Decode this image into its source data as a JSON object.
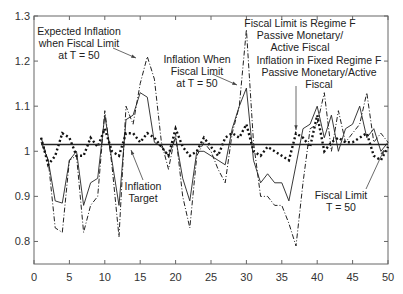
{
  "chart_data": {
    "type": "line",
    "title": "",
    "xlabel": "",
    "ylabel": "",
    "xlim": [
      0,
      50
    ],
    "ylim": [
      0.75,
      1.3
    ],
    "grid": false,
    "x_ticks": [
      0,
      5,
      10,
      15,
      20,
      25,
      30,
      35,
      40,
      45,
      50
    ],
    "y_ticks": [
      0.8,
      0.9,
      1.0,
      1.1,
      1.2,
      1.3
    ],
    "y_tick_labels": [
      "0.8",
      "0.9",
      "1",
      "1.1",
      "1.2",
      "1.3"
    ],
    "x": [
      1,
      2,
      3,
      4,
      5,
      6,
      7,
      8,
      9,
      10,
      11,
      12,
      13,
      14,
      15,
      16,
      17,
      18,
      19,
      20,
      21,
      22,
      23,
      24,
      25,
      26,
      27,
      28,
      29,
      30,
      31,
      32,
      33,
      34,
      35,
      36,
      37,
      38,
      39,
      40,
      41,
      42,
      43,
      44,
      45,
      46,
      47,
      48,
      49,
      50
    ],
    "series": [
      {
        "name": "Inflation When Fiscal Limit at T = 50",
        "style": "solid",
        "values": [
          1.02,
          0.98,
          0.89,
          0.885,
          0.98,
          1.0,
          0.88,
          0.93,
          0.94,
          1.08,
          0.98,
          0.88,
          1.07,
          1.08,
          1.13,
          1.12,
          1.02,
          1.01,
          0.99,
          1.03,
          0.94,
          0.89,
          1.0,
          1.0,
          0.99,
          0.98,
          0.97,
          1.05,
          1.1,
          1.14,
          0.98,
          0.93,
          0.95,
          0.93,
          0.93,
          0.89,
          0.97,
          1.05,
          1.06,
          1.1,
          1.03,
          1.08,
          1.0,
          1.05,
          1.06,
          1.1,
          1.03,
          1.05,
          1.0,
          1.02
        ]
      },
      {
        "name": "Expected Inflation when Fiscal Limit at T = 50",
        "style": "dash-dot",
        "values": [
          1.03,
          0.98,
          0.83,
          0.82,
          0.98,
          0.99,
          0.82,
          0.88,
          0.9,
          1.09,
          0.97,
          0.81,
          1.1,
          1.06,
          1.15,
          1.21,
          1.16,
          1.02,
          0.96,
          1.04,
          0.9,
          0.83,
          0.99,
          1.02,
          1.0,
          0.96,
          0.93,
          1.04,
          1.1,
          1.27,
          1.02,
          0.9,
          0.9,
          0.88,
          0.88,
          0.84,
          0.79,
          0.93,
          1.05,
          1.06,
          1.13,
          1.0,
          1.09,
          1.02,
          1.04,
          1.06,
          1.13,
          1.02,
          1.04,
          1.02
        ]
      },
      {
        "name": "Inflation in Fixed Regime F Passive Monetary/Active Fiscal",
        "style": "dotted-bold",
        "values": [
          1.03,
          0.97,
          0.99,
          1.04,
          1.03,
          0.99,
          0.99,
          1.03,
          1.01,
          1.05,
          1.0,
          0.99,
          1.04,
          1.04,
          1.02,
          1.04,
          1.03,
          1.01,
          0.99,
          1.05,
          1.01,
          0.99,
          1.0,
          1.03,
          1.01,
          0.99,
          1.03,
          1.04,
          1.03,
          1.06,
          1.0,
          0.99,
          1.01,
          1.0,
          0.99,
          0.98,
          1.04,
          1.03,
          1.01,
          1.08,
          1.0,
          1.02,
          1.03,
          1.02,
          1.02,
          1.03,
          1.04,
          0.99,
          0.98,
          1.01
        ]
      },
      {
        "name": "Inflation Target",
        "style": "solid-bold",
        "values": [
          1.015,
          1.015,
          1.015,
          1.015,
          1.015,
          1.015,
          1.015,
          1.015,
          1.015,
          1.015,
          1.015,
          1.015,
          1.015,
          1.015,
          1.015,
          1.015,
          1.015,
          1.015,
          1.015,
          1.015,
          1.015,
          1.015,
          1.015,
          1.015,
          1.015,
          1.015,
          1.015,
          1.015,
          1.015,
          1.015,
          1.015,
          1.015,
          1.015,
          1.015,
          1.015,
          1.015,
          1.015,
          1.015,
          1.015,
          1.015,
          1.015,
          1.015,
          1.015,
          1.015,
          1.015,
          1.015,
          1.015,
          1.015,
          1.015,
          1.015
        ]
      }
    ],
    "annotations": [
      {
        "lines": [
          "Expected Inflation",
          "when Fiscal Limit",
          "at T = 50"
        ],
        "text_x": 79,
        "text_y": 35,
        "arrow_to": [
          136,
          58
        ]
      },
      {
        "lines": [
          "Inflation When",
          "Fiscal Limit",
          "at T = 50"
        ],
        "text_x": 197,
        "text_y": 63,
        "arrow_to": [
          237,
          85
        ]
      },
      {
        "lines": [
          "Fiscal Limit is Regime F",
          "Passive Monetary/",
          "Active Fiscal"
        ],
        "text_x": 300,
        "text_y": 27,
        "arrow_to": null
      },
      {
        "lines": [
          "Inflation in Fixed Regime F",
          "Passive Monetary/Active",
          "Fiscal"
        ],
        "text_x": 319,
        "text_y": 64,
        "arrow_to": [
          296,
          130
        ]
      },
      {
        "lines": [
          "Inflation",
          "Target"
        ],
        "text_x": 143,
        "text_y": 190,
        "arrow_to": [
          132,
          152
        ]
      },
      {
        "lines": [
          "Fiscal Limit",
          "T = 50"
        ],
        "text_x": 341,
        "text_y": 199,
        "arrow_to": [
          384,
          150
        ]
      }
    ]
  }
}
